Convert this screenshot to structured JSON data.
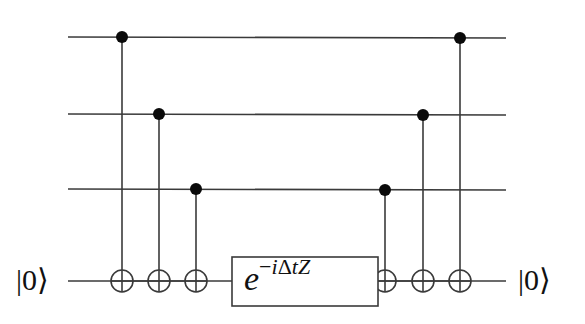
{
  "diagram": {
    "type": "quantum-circuit",
    "colors": {
      "line": "#3a3a3a",
      "control": "#0a0a0a",
      "background": "#ffffff"
    },
    "wires": [
      {
        "id": "q0",
        "y": 37
      },
      {
        "id": "q1",
        "y": 114
      },
      {
        "id": "q2",
        "y": 189
      },
      {
        "id": "ancilla",
        "y": 281
      }
    ],
    "wire_x_start": 68,
    "wire_x_end": 506,
    "ancilla_input_label": "|0⟩",
    "ancilla_output_label": "|0⟩",
    "cnots": [
      {
        "x": 122,
        "control": "q0",
        "target": "ancilla"
      },
      {
        "x": 159,
        "control": "q1",
        "target": "ancilla"
      },
      {
        "x": 196,
        "control": "q2",
        "target": "ancilla"
      },
      {
        "x": 385,
        "control": "q2",
        "target": "ancilla"
      },
      {
        "x": 423,
        "control": "q1",
        "target": "ancilla"
      },
      {
        "x": 460,
        "control": "q0",
        "target": "ancilla"
      }
    ],
    "rotation_gate": {
      "label_base": "e",
      "label_exponent": "−iΔtZ",
      "exp_minus": "−",
      "exp_i": "i",
      "exp_delta": "Δ",
      "exp_t": "t",
      "exp_Z": "Z",
      "box": {
        "x": 232,
        "y": 257,
        "width": 146,
        "height": 49
      }
    }
  }
}
